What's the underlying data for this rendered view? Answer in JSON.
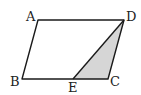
{
  "figure": {
    "type": "parallelogram-with-shaded-triangle",
    "colors": {
      "background": "#ffffff",
      "stroke": "#1a1a1a",
      "shade": "#d6d6d6"
    },
    "vertices": {
      "A": {
        "label": "A",
        "x": 38,
        "y": 20
      },
      "B": {
        "label": "B",
        "x": 22,
        "y": 79
      },
      "C": {
        "label": "C",
        "x": 108,
        "y": 79
      },
      "D": {
        "label": "D",
        "x": 124,
        "y": 20
      },
      "E": {
        "label": "E",
        "x": 73,
        "y": 79
      }
    },
    "shaded_region": [
      "D",
      "E",
      "C"
    ]
  }
}
